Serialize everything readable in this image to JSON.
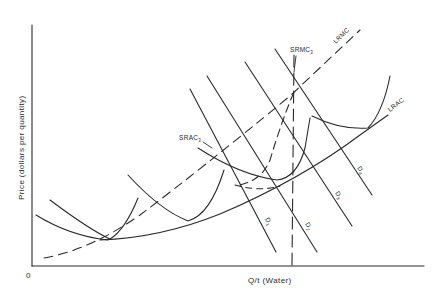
{
  "diagram": {
    "type": "economics-cost-curves",
    "y_axis_label": "Price (dollars per quantity)",
    "x_axis_label": "Q/t (Water)",
    "origin_label": "0",
    "curves": {
      "lrmc": {
        "label": "LRMC",
        "style": "dashed"
      },
      "lrac": {
        "label": "LRAC",
        "style": "solid"
      },
      "srac3": {
        "label": "SRAC",
        "subscript": "3",
        "style": "solid"
      },
      "srmc3": {
        "label": "SRMC",
        "subscript": "3",
        "style": "dashed"
      },
      "srac_curves_count": 5,
      "demand": [
        {
          "label": "D",
          "subscript": "1"
        },
        {
          "label": "D",
          "subscript": "2"
        },
        {
          "label": "D",
          "subscript": "3"
        },
        {
          "label": "D",
          "subscript": "4"
        }
      ]
    },
    "colors": {
      "ink": "#2a2a2a",
      "background": "#ffffff"
    }
  }
}
